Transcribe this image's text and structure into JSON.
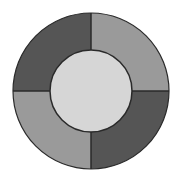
{
  "diagram": {
    "type": "ring",
    "center": {
      "x": 91,
      "y": 91
    },
    "outer_radius": 78,
    "inner_radius": 41,
    "stroke_color": "#2a2a2a",
    "inner_fill": "#d6d6d6",
    "quadrants": [
      {
        "position": "top-left",
        "fill": "#555555"
      },
      {
        "position": "top-right",
        "fill": "#9a9a9a"
      },
      {
        "position": "bottom-right",
        "fill": "#555555"
      },
      {
        "position": "bottom-left",
        "fill": "#9a9a9a"
      }
    ]
  }
}
